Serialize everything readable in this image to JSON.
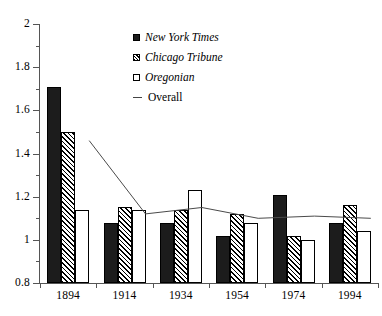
{
  "chart_data": {
    "type": "bar",
    "title": "",
    "subtitle": "",
    "xlabel": "",
    "ylabel": "",
    "categories": [
      "1894",
      "1914",
      "1934",
      "1954",
      "1974",
      "1994"
    ],
    "ylim": [
      0.8,
      2
    ],
    "y_ticks": [
      "2",
      "1.8",
      "1.6",
      "1.4",
      "1.2",
      "1",
      "0.8"
    ],
    "y_tick_values": [
      2,
      1.8,
      1.6,
      1.4,
      1.2,
      1,
      0.8
    ],
    "y_minor_tick_values": [
      1.9,
      1.7,
      1.5,
      1.3,
      1.1,
      0.9
    ],
    "grid": false,
    "legend_position": "top-center",
    "series": [
      {
        "name": "New York Times",
        "style": "bar-filled",
        "values": [
          1.71,
          1.08,
          1.08,
          1.02,
          1.21,
          1.08
        ]
      },
      {
        "name": "Chicago Tribune",
        "style": "bar-hatched",
        "values": [
          1.5,
          1.15,
          1.14,
          1.12,
          1.02,
          1.16
        ]
      },
      {
        "name": "Oregonian",
        "style": "bar-open",
        "values": [
          1.14,
          1.14,
          1.23,
          1.08,
          1.0,
          1.04
        ]
      },
      {
        "name": "Overall",
        "style": "line",
        "values": [
          1.46,
          1.12,
          1.15,
          1.1,
          1.11,
          1.1
        ]
      }
    ]
  },
  "legend": {
    "items": [
      {
        "label": "New York Times",
        "swatch": "filled-square-icon",
        "italic": true
      },
      {
        "label": "Chicago Tribune",
        "swatch": "hatched-square-icon",
        "italic": true
      },
      {
        "label": "Oregonian",
        "swatch": "open-square-icon",
        "italic": true
      },
      {
        "label": "Overall",
        "swatch": "line-segment-icon",
        "italic": false
      }
    ]
  }
}
